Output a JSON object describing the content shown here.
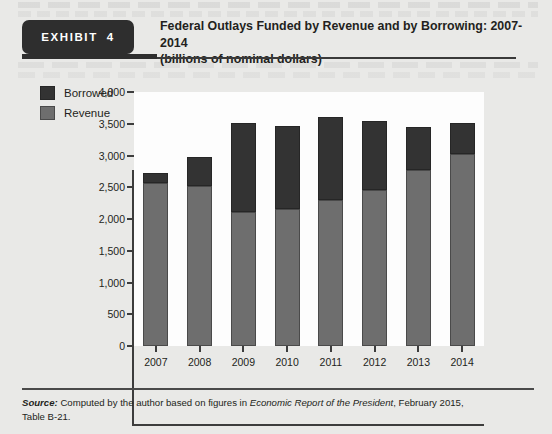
{
  "exhibit": {
    "badge_word": "EXHIBIT",
    "badge_number": "4",
    "title_line1": "Federal Outlays Funded by Revenue and by Borrowing: 2007-2014",
    "title_line2": "(billions of nominal dollars)"
  },
  "source": {
    "label": "Source:",
    "text_before_italic": " Computed by the author based on figures in ",
    "italic_work": "Economic Report of the President",
    "text_after_italic": ", February 2015,",
    "line2": "Table B-21."
  },
  "colors": {
    "borrowed": "#333333",
    "revenue": "#6e6e6e",
    "page_background": "#e9e9e7",
    "plot_background": "#fdfdfd",
    "axis": "#3d3d3d",
    "badge": "#2e2e2e"
  },
  "chart_data": {
    "type": "bar",
    "stacked": true,
    "title": "Federal Outlays Funded by Revenue and by Borrowing: 2007-2014",
    "subtitle": "(billions of nominal dollars)",
    "xlabel": "",
    "ylabel": "",
    "grid": false,
    "legend_position": "top-left",
    "categories": [
      "2007",
      "2008",
      "2009",
      "2010",
      "2011",
      "2012",
      "2013",
      "2014"
    ],
    "ylim": [
      0,
      4000
    ],
    "yticks": [
      0,
      500,
      1000,
      1500,
      2000,
      2500,
      3000,
      3500,
      4000
    ],
    "ytick_labels": [
      "0",
      "500",
      "1,000",
      "1,500",
      "2,000",
      "2,500",
      "3,000",
      "3,500",
      "4,000"
    ],
    "series": [
      {
        "name": "Revenue",
        "color": "#6e6e6e",
        "values": [
          2570,
          2525,
          2105,
          2160,
          2300,
          2450,
          2775,
          3020
        ]
      },
      {
        "name": "Borrowed",
        "color": "#333333",
        "values": [
          160,
          455,
          1415,
          1300,
          1300,
          1090,
          680,
          485
        ]
      }
    ],
    "totals": [
      2730,
      2980,
      3520,
      3460,
      3600,
      3540,
      3455,
      3505
    ]
  }
}
